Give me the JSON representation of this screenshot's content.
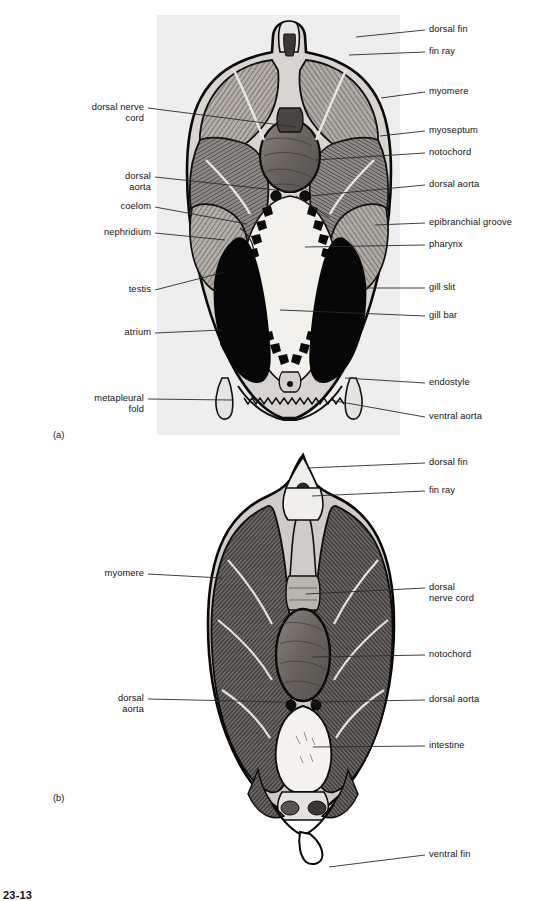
{
  "figure": {
    "number": "23-13",
    "panels": [
      {
        "letter": "(a)",
        "caption_key": "pharyngeal-region-cross-section"
      },
      {
        "letter": "(b)",
        "caption_key": "intestinal-region-cross-section"
      }
    ]
  },
  "panel_a": {
    "letter": "(a)",
    "labels_right": [
      {
        "text": "dorsal fin",
        "y": 30,
        "lx": 356,
        "ly": 37
      },
      {
        "text": "fin ray",
        "y": 52,
        "lx": 349,
        "ly": 55
      },
      {
        "text": "myomere",
        "y": 92,
        "lx": 381,
        "ly": 98
      },
      {
        "text": "myoseptum",
        "y": 131,
        "lx": 380,
        "ly": 136
      },
      {
        "text": "notochord",
        "y": 153,
        "lx": 315,
        "ly": 160
      },
      {
        "text": "dorsal aorta",
        "y": 185,
        "lx": 310,
        "ly": 196
      },
      {
        "text": "epibranchial groove",
        "y": 223,
        "lx": 375,
        "ly": 225
      },
      {
        "text": "pharynx",
        "y": 245,
        "lx": 305,
        "ly": 247
      },
      {
        "text": "gill slit",
        "y": 288,
        "lx": 365,
        "ly": 288
      },
      {
        "text": "gill bar",
        "y": 316,
        "lx": 330,
        "ly": 312
      },
      {
        "text": "endostyle",
        "y": 383,
        "lx": 345,
        "ly": 378
      },
      {
        "text": "ventral aorta",
        "y": 417,
        "lx": 330,
        "ly": 400
      }
    ],
    "labels_left": [
      {
        "text": "dorsal nerve\ncord",
        "y": 108,
        "lx": 296,
        "ly": 127
      },
      {
        "text": "dorsal\naorta",
        "y": 177,
        "lx": 294,
        "ly": 192
      },
      {
        "text": "coelom",
        "y": 207,
        "lx": 247,
        "ly": 224
      },
      {
        "text": "nephridium",
        "y": 233,
        "lx": 225,
        "ly": 240
      },
      {
        "text": "testis",
        "y": 290,
        "lx": 225,
        "ly": 272
      },
      {
        "text": "atrium",
        "y": 333,
        "lx": 222,
        "ly": 330
      },
      {
        "text": "metapleural\nfold",
        "y": 399,
        "lx": 232,
        "ly": 400
      }
    ]
  },
  "panel_b": {
    "letter": "(b)",
    "labels_right": [
      {
        "text": "dorsal fin",
        "y": 463,
        "lx": 307,
        "ly": 468
      },
      {
        "text": "fin ray",
        "y": 491,
        "lx": 312,
        "ly": 496
      },
      {
        "text": "dorsal\nnerve cord",
        "y": 588,
        "lx": 306,
        "ly": 594
      },
      {
        "text": "notochord",
        "y": 655,
        "lx": 312,
        "ly": 657
      },
      {
        "text": "dorsal aorta",
        "y": 700,
        "lx": 310,
        "ly": 702
      },
      {
        "text": "intestine",
        "y": 746,
        "lx": 313,
        "ly": 747
      },
      {
        "text": "ventral fin",
        "y": 855,
        "lx": 329,
        "ly": 867
      }
    ],
    "labels_left": [
      {
        "text": "myomere",
        "y": 574,
        "lx": 222,
        "ly": 578
      },
      {
        "text": "dorsal\naorta",
        "y": 699,
        "lx": 283,
        "ly": 702
      }
    ]
  },
  "colors": {
    "panel_a_background": "#eeeeee",
    "ink": "#121212",
    "leader_line": "#2a2a2a",
    "tissue_mid": "#9a958f",
    "tissue_dark": "#3d3a37",
    "notochord": "#6e6864",
    "cavity_light": "#efefea",
    "black_organ": "#070707"
  },
  "structures": {
    "panel_a": [
      "dorsal fin",
      "fin ray",
      "myomere",
      "myoseptum",
      "notochord",
      "dorsal nerve cord",
      "dorsal aorta",
      "coelom",
      "nephridium",
      "epibranchial groove",
      "pharynx",
      "gill slit",
      "gill bar",
      "testis",
      "atrium",
      "endostyle",
      "metapleural fold",
      "ventral aorta"
    ],
    "panel_b": [
      "dorsal fin",
      "fin ray",
      "myomere",
      "dorsal nerve cord",
      "notochord",
      "dorsal aorta",
      "intestine",
      "ventral fin"
    ]
  }
}
